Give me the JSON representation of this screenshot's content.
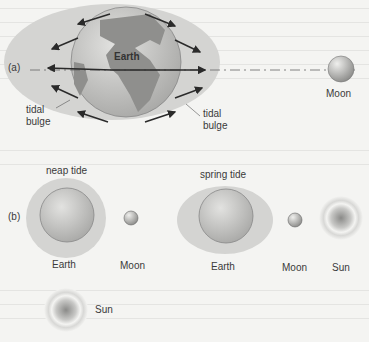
{
  "panel_a": {
    "label": "(a)",
    "earth_label": "Earth",
    "moon_label": "Moon",
    "bulge_left_label": [
      "tidal",
      "bulge"
    ],
    "bulge_right_label": [
      "tidal",
      "bulge"
    ]
  },
  "panel_b": {
    "label": "(b)",
    "neap": {
      "title": "neap tide",
      "earth_label": "Earth",
      "moon_label": "Moon",
      "sun_label": "Sun"
    },
    "spring": {
      "title": "spring tide",
      "earth_label": "Earth",
      "moon_label": "Moon",
      "sun_label": "Sun"
    }
  },
  "colors": {
    "background": "#f4f4f2",
    "bulge": "#d4d4d2",
    "earth": "#b8b8b6",
    "land": "#8f8f8d",
    "arrow": "#2a2a2a"
  }
}
